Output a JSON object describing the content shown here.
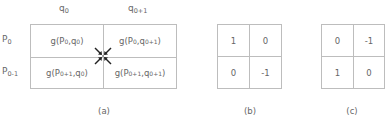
{
  "figure_a": {
    "col_headers": [
      {
        "base": "q",
        "sub": "0"
      },
      {
        "base": "q",
        "sub": "0+1"
      }
    ],
    "row_headers": [
      {
        "base": "P",
        "sub": "0"
      },
      {
        "base": "P",
        "sub": "0-1"
      }
    ],
    "cells": [
      [
        {
          "prefix": "g(P",
          "p_sub": "0",
          "mid": ",q",
          "q_sub": "0",
          "suffix": ")"
        },
        {
          "prefix": "g(P",
          "p_sub": "0",
          "mid": ",q",
          "q_sub": "0+1",
          "suffix": ")"
        }
      ],
      [
        {
          "prefix": "g(P",
          "p_sub": "0+1",
          "mid": ",q",
          "q_sub": "0",
          "suffix": ")"
        },
        {
          "prefix": "g(P",
          "p_sub": "0+1",
          "mid": ",q",
          "q_sub": "0+1",
          "suffix": ")"
        }
      ]
    ],
    "center_marker": "four-inward-arrows",
    "caption": "(a)"
  },
  "figure_b": {
    "cells": [
      [
        "1",
        "0"
      ],
      [
        "0",
        "-1"
      ]
    ],
    "caption": "(b)"
  },
  "figure_c": {
    "cells": [
      [
        "0",
        "-1"
      ],
      [
        "1",
        "0"
      ]
    ],
    "caption": "(c)"
  }
}
